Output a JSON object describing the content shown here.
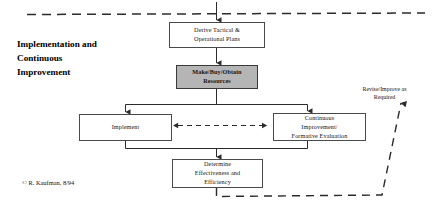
{
  "diagram": {
    "title_lines": [
      "Implementation and",
      "Continuous",
      "Improvement"
    ],
    "title_text": "Implementation and Continuous Improvement",
    "copyright": "© R. Kaufman, 8/94",
    "feedback_label_lines": [
      "Revise/Improve as",
      "Required"
    ],
    "feedback_label_text": "Revise/Improve as Required",
    "nodes": [
      {
        "id": "derive",
        "label_lines": [
          "Derive Tactical &",
          "Operational Plans"
        ],
        "label": "Derive Tactical & Operational Plans",
        "fill": "#ffffff",
        "emphasis": false
      },
      {
        "id": "make",
        "label_lines": [
          "Make/Buy/Obtain",
          "Resources"
        ],
        "label": "Make/Buy/Obtain Resources",
        "fill": "#b5b5b5",
        "emphasis": true
      },
      {
        "id": "implement",
        "label_lines": [
          "Implement"
        ],
        "label": "Implement",
        "fill": "#ffffff",
        "emphasis": false
      },
      {
        "id": "continuous",
        "label_lines": [
          "Continuous",
          "Improvement/",
          "Formative Evaluation"
        ],
        "label": "Continuous Improvement/ Formative Evaluation",
        "fill": "#ffffff",
        "emphasis": false
      },
      {
        "id": "determine",
        "label_lines": [
          "Determine",
          "Effectiveness and",
          "Efficiency"
        ],
        "label": "Determine Effectiveness and Efficiency",
        "fill": "#ffffff",
        "emphasis": false
      }
    ],
    "connectors": [
      {
        "name": "top-boundary-dashed-line",
        "style": "dashed",
        "direction": "horizontal"
      },
      {
        "name": "entry-arrow-into-derive",
        "style": "solid",
        "direction": "down"
      },
      {
        "name": "derive-to-make-arrow",
        "style": "solid",
        "direction": "down"
      },
      {
        "name": "make-to-branch-bus",
        "style": "solid",
        "direction": "down"
      },
      {
        "name": "branch-to-implement-arrow",
        "style": "solid",
        "direction": "down"
      },
      {
        "name": "branch-to-continuous-arrow",
        "style": "solid",
        "direction": "down"
      },
      {
        "name": "implement-continuous-dashed-double-arrow",
        "style": "dashed",
        "direction": "bidirectional"
      },
      {
        "name": "merge-bus-to-determine-arrow",
        "style": "solid",
        "direction": "down"
      },
      {
        "name": "determine-feedback-dashed-loop",
        "style": "dashed",
        "direction": "up"
      }
    ],
    "colors": {
      "line": "#2b2b2b",
      "box_border": "#4a4a4a",
      "emphasis_fill": "#b5b5b5",
      "background": "#ffffff",
      "text": "#141414"
    }
  }
}
